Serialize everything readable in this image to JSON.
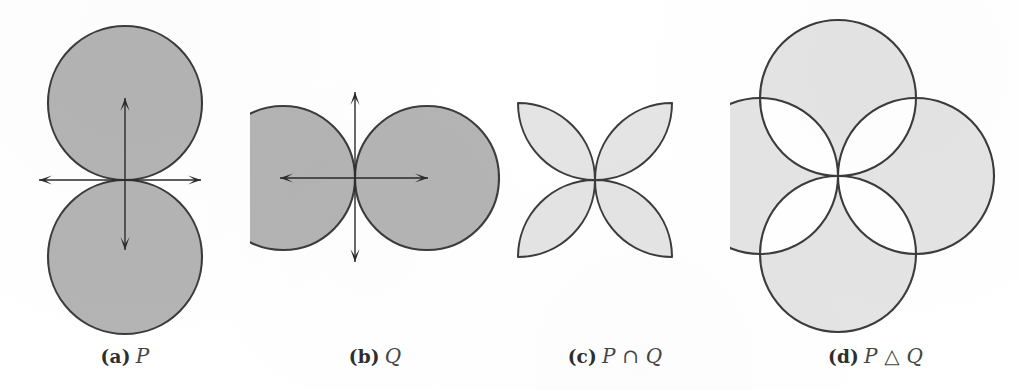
{
  "figure": {
    "background_color": "#ffffff",
    "stroke_color": "#3c3c3c",
    "dark_fill_color": "#b4b4b4",
    "light_fill_color": "#e4e4e4",
    "hole_fill_color": "#ffffff",
    "axis_color": "#2b2b2b"
  },
  "panels": [
    {
      "id": "a",
      "tag": "(a)",
      "label": "P",
      "caption_full": "(a) P",
      "kind": "two-circles-vertical",
      "fill": "#b4b4b4",
      "has_axes": true,
      "center": {
        "x": 125,
        "y": 180
      },
      "radius": 77,
      "circles": [
        {
          "name": "upper",
          "cx": 125,
          "cy": 103,
          "r": 77
        },
        {
          "name": "lower",
          "cx": 125,
          "cy": 257,
          "r": 77
        }
      ],
      "axes": {
        "horizontal": {
          "x1": 39,
          "x2": 201,
          "y": 180
        },
        "vertical": {
          "y1": 98,
          "y2": 250,
          "x": 125
        }
      }
    },
    {
      "id": "b",
      "tag": "(b)",
      "label": "Q",
      "caption_full": "(b) Q",
      "kind": "two-circles-horizontal",
      "fill": "#b4b4b4",
      "has_axes": true,
      "center": {
        "x": 355,
        "y": 178
      },
      "radius": 72,
      "circles": [
        {
          "name": "left",
          "cx": 283,
          "cy": 178,
          "r": 72
        },
        {
          "name": "right",
          "cx": 427,
          "cy": 178,
          "r": 72
        }
      ],
      "axes": {
        "horizontal": {
          "x1": 280,
          "x2": 428,
          "y": 178
        },
        "vertical": {
          "y1": 92,
          "y2": 262,
          "x": 355
        }
      }
    },
    {
      "id": "c",
      "tag": "(c)",
      "label": "P ∩ Q",
      "caption_full": "(c) P ∩ Q",
      "kind": "four-petal-rosette",
      "fill": "#e4e4e4",
      "has_axes": false,
      "center": {
        "x": 595,
        "y": 180
      },
      "radius": 77,
      "petals": [
        "upper-left",
        "upper-right",
        "lower-right",
        "lower-left"
      ]
    },
    {
      "id": "d",
      "tag": "(d)",
      "label": "P △ Q",
      "caption_full": "(d) P △ Q",
      "kind": "four-circles-with-petal-holes",
      "fill": "#e4e4e4",
      "has_axes": false,
      "center": {
        "x": 838,
        "y": 176
      },
      "radius": 78,
      "circles": [
        {
          "name": "north",
          "cx": 838,
          "cy": 98,
          "r": 78
        },
        {
          "name": "east",
          "cx": 916,
          "cy": 176,
          "r": 78
        },
        {
          "name": "south",
          "cx": 838,
          "cy": 254,
          "r": 78
        },
        {
          "name": "west",
          "cx": 760,
          "cy": 176,
          "r": 78
        }
      ],
      "holes": [
        "upper-left",
        "upper-right",
        "lower-right",
        "lower-left"
      ]
    }
  ]
}
